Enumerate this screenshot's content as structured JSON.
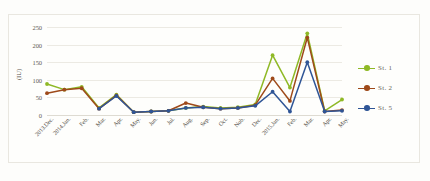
{
  "chart_data": {
    "type": "line",
    "title": "",
    "xlabel": "",
    "ylabel": "(IU)",
    "ylim": [
      0,
      250
    ],
    "yticks": [
      0,
      50,
      100,
      150,
      200,
      250
    ],
    "grid": true,
    "legend_position": "right",
    "categories": [
      "2013.Dec.",
      "2014.Jan.",
      "Feb.",
      "Mar.",
      "Apr.",
      "May.",
      "Jun.",
      "Jul.",
      "Aug.",
      "Sep.",
      "Oct.",
      "Nob.",
      "Dec.",
      "2015.Jan.",
      "Feb.",
      "Mar.",
      "Apr.",
      "May."
    ],
    "series": [
      {
        "name": "St. 1",
        "color": "#8fb926",
        "values": [
          88,
          72,
          80,
          20,
          58,
          8,
          10,
          12,
          20,
          24,
          20,
          22,
          30,
          170,
          78,
          232,
          12,
          44
        ]
      },
      {
        "name": "St. 2",
        "color": "#9e4a1a",
        "values": [
          62,
          72,
          76,
          18,
          56,
          8,
          10,
          12,
          34,
          22,
          18,
          20,
          28,
          104,
          40,
          220,
          10,
          14
        ]
      },
      {
        "name": "St. 5",
        "color": "#2f5596",
        "values": [
          null,
          null,
          null,
          18,
          54,
          8,
          10,
          12,
          20,
          22,
          18,
          20,
          26,
          66,
          10,
          150,
          10,
          12
        ]
      }
    ]
  },
  "legend": {
    "entries": [
      {
        "label": "St. 1",
        "color": "#8fb926"
      },
      {
        "label": "St. 2",
        "color": "#9e4a1a"
      },
      {
        "label": "St. 5",
        "color": "#2f5596"
      }
    ]
  }
}
